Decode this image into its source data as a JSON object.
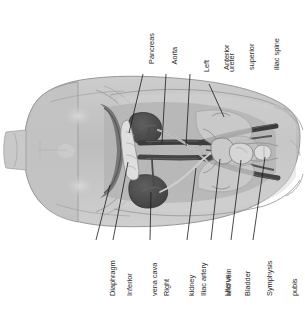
{
  "figure": {
    "orientation": "rotated-90-ccw",
    "background_color": "#ffffff",
    "body_fill": "#b9b9b9",
    "organ_dark": "#4a4a4a",
    "vessel_color": "#3c3c3c",
    "leader_color": "#1a1a1a",
    "text_color": "#2a2a2a"
  },
  "labels_top": [
    {
      "id": "pancreas",
      "text": "Pancreas",
      "lines": [
        "Pancreas"
      ]
    },
    {
      "id": "aorta",
      "text": "Aorta",
      "lines": [
        "Aorta"
      ]
    },
    {
      "id": "left-ureter",
      "text": "Left ureter",
      "lines": [
        "Left",
        "ureter"
      ]
    },
    {
      "id": "asis",
      "text": "Anterior superior iliac spine",
      "lines": [
        "Anterior",
        "superior",
        "iliac spine"
      ]
    }
  ],
  "labels_bottom": [
    {
      "id": "diaphragm",
      "text": "Diaphragm",
      "lines": [
        "Diaphragm"
      ]
    },
    {
      "id": "inferior-vena-cava",
      "text": "Inferior vena cava",
      "lines": [
        "Inferior",
        "vena cava"
      ]
    },
    {
      "id": "right-kidney",
      "text": "Right kidney",
      "lines": [
        "Right",
        "kidney"
      ]
    },
    {
      "id": "iliac-artery-vein",
      "text": "Iliac artery and vein",
      "lines": [
        "Iliac artery",
        "and vein"
      ]
    },
    {
      "id": "uterus",
      "text": "Uterus",
      "lines": [
        "Uterus"
      ]
    },
    {
      "id": "bladder",
      "text": "Bladder",
      "lines": [
        "Bladder"
      ]
    },
    {
      "id": "symphysis-pubis",
      "text": "Symphysis pubis",
      "lines": [
        "Symphysis",
        "pubis"
      ]
    }
  ]
}
